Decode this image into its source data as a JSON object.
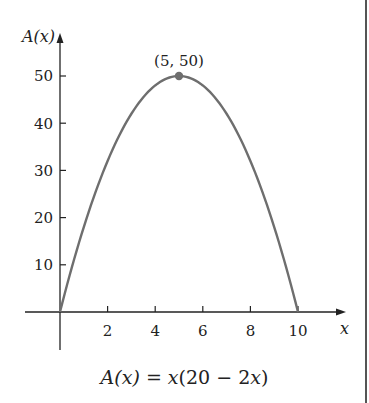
{
  "chart_data": {
    "type": "line",
    "title": "",
    "function": "A(x) = x(20 - 2x)",
    "xlabel": "x",
    "ylabel": "A(x)",
    "xlim": [
      -1.5,
      11.5
    ],
    "ylim": [
      0,
      55
    ],
    "x_ticks": [
      2,
      4,
      6,
      8,
      10
    ],
    "y_ticks": [
      10,
      20,
      30,
      40,
      50
    ],
    "grid": false,
    "series": [
      {
        "name": "A(x)",
        "x": [
          0,
          1,
          2,
          3,
          4,
          5,
          6,
          7,
          8,
          9,
          10
        ],
        "y": [
          0,
          18,
          32,
          42,
          48,
          50,
          48,
          42,
          32,
          18,
          0
        ],
        "color": "#6e6e6e"
      }
    ],
    "annotations": [
      {
        "label": "(5, 50)",
        "x": 5,
        "y": 50,
        "marker": "dot"
      }
    ]
  },
  "labels": {
    "y_axis": "A(x)",
    "x_axis": "x",
    "point": "(5, 50)",
    "caption_lhs": "A(x)",
    "caption_eq": " = ",
    "caption_rhs_a": "x",
    "caption_rhs_b": "(20 − 2",
    "caption_rhs_c": "x",
    "caption_rhs_d": ")",
    "x_ticks": [
      "2",
      "4",
      "6",
      "8",
      "10"
    ],
    "y_ticks": [
      "10",
      "20",
      "30",
      "40",
      "50"
    ]
  },
  "colors": {
    "curve": "#6e6e6e",
    "axis": "#222222",
    "point": "#6e6e6e"
  }
}
